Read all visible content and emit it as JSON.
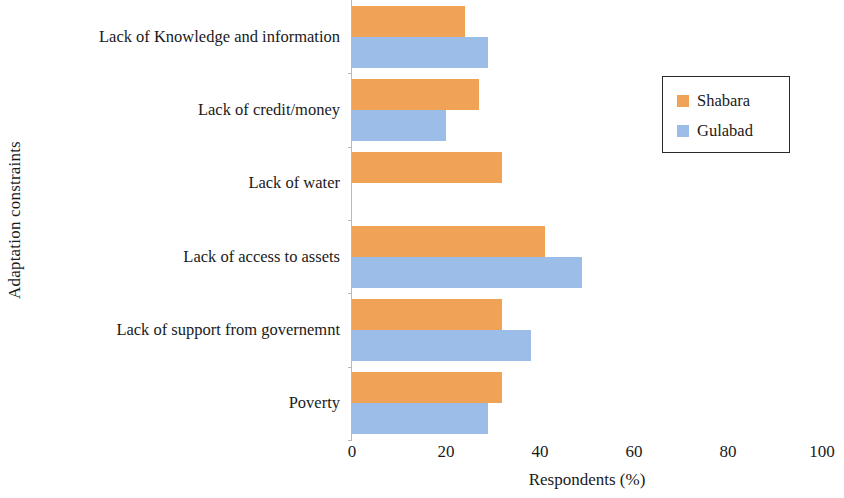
{
  "chart_data": {
    "type": "bar",
    "orientation": "horizontal",
    "title": "",
    "xlabel": "Respondents (%)",
    "ylabel": "Adaptation constraints",
    "xlim": [
      0,
      100
    ],
    "xticks": [
      0,
      20,
      40,
      60,
      80,
      100
    ],
    "xtick_labels": [
      "0",
      "20",
      "40",
      "60",
      "80",
      "100"
    ],
    "grid": false,
    "legend_position": "top-right",
    "categories": [
      "Lack of Knowledge and information",
      "Lack of credit/money",
      "Lack of water",
      "Lack of access to assets",
      "Lack of support from governemnt",
      "Poverty"
    ],
    "series": [
      {
        "name": "Shabara",
        "color": "#f0a356",
        "values": [
          24,
          27,
          32,
          41,
          32,
          32
        ]
      },
      {
        "name": "Gulabad",
        "color": "#9dbde9",
        "values": [
          29,
          20,
          0,
          49,
          38,
          29
        ]
      }
    ]
  },
  "legend": {
    "items": [
      {
        "label": "Shabara",
        "swatch": "legend-swatch-shabara"
      },
      {
        "label": "Gulabad",
        "swatch": "legend-swatch-gulabad"
      }
    ]
  }
}
